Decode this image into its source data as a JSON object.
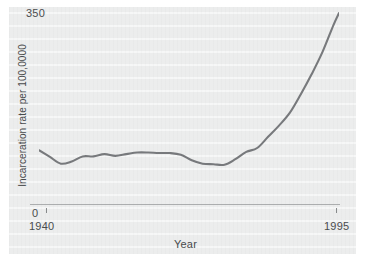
{
  "chart_data": {
    "type": "line",
    "title": "",
    "subtitle": "",
    "xlabel": "Year",
    "ylabel": "Incarceration rate per 100,0000",
    "xlim": [
      1940,
      1995
    ],
    "ylim": [
      0,
      350
    ],
    "grid": false,
    "legend": null,
    "x_tick_labels": [
      "1940",
      "1995"
    ],
    "y_tick_labels": [
      "0",
      "350"
    ],
    "axis_min_label": "0",
    "axis_max_label": "350",
    "series": [
      {
        "name": "Incarceration rate",
        "color": "#77797c",
        "x": [
          1940,
          1942,
          1944,
          1946,
          1948,
          1950,
          1952,
          1954,
          1956,
          1958,
          1960,
          1962,
          1964,
          1966,
          1968,
          1970,
          1972,
          1974,
          1976,
          1978,
          1980,
          1982,
          1984,
          1986,
          1988,
          1990,
          1992,
          1994,
          1995
        ],
        "values": [
          96,
          84,
          72,
          76,
          85,
          85,
          89,
          86,
          89,
          92,
          92,
          91,
          91,
          88,
          78,
          72,
          71,
          70,
          80,
          93,
          100,
          120,
          140,
          163,
          196,
          232,
          272,
          320,
          341
        ]
      }
    ],
    "annotations": []
  },
  "axis": {
    "y_max": "350",
    "y_min": "0",
    "y_title": "Incarceration rate per 100,0000",
    "x_left": "1940",
    "x_right": "1995",
    "x_title": "Year"
  }
}
